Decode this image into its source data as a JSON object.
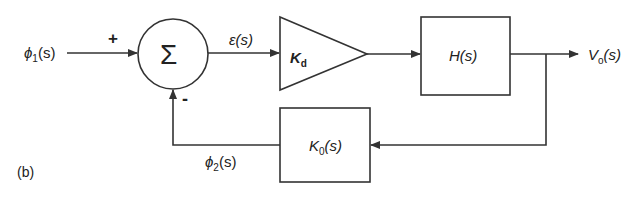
{
  "figure_label": "(b)",
  "input": {
    "label": "ϕ",
    "sub": "1",
    "arg": "(s)"
  },
  "summing_junction": {
    "symbol": "Σ",
    "plus_sign": "+",
    "minus_sign": "-"
  },
  "error_signal": {
    "label": "ε(s)"
  },
  "amplifier": {
    "label": "K",
    "sub": "d"
  },
  "plant": {
    "label": "H(s)"
  },
  "output": {
    "label": "V",
    "sub": "o",
    "arg": "(s)"
  },
  "feedback_block": {
    "label": "K",
    "sub": "0",
    "arg": "(s)"
  },
  "feedback_signal": {
    "label": "ϕ",
    "sub": "2",
    "arg": "(s)"
  },
  "colors": {
    "stroke": "#333333",
    "background": "#ffffff"
  }
}
